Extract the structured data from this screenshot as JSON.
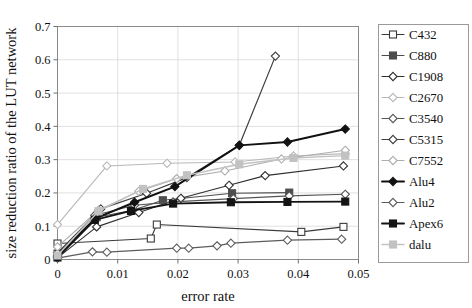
{
  "chart_data": {
    "type": "line",
    "title": "",
    "xlabel": "error rate",
    "ylabel": "size reduction ratio of the LUT network",
    "xlim": [
      0,
      0.05
    ],
    "ylim": [
      0,
      0.7
    ],
    "xticks": [
      0,
      0.01,
      0.02,
      0.03,
      0.04,
      0.05
    ],
    "xtick_labels": [
      "0",
      "0.01",
      "0.02",
      "0.03",
      "0.04",
      "0.05"
    ],
    "yticks": [
      0,
      0.1,
      0.2,
      0.3,
      0.4,
      0.5,
      0.6,
      0.7
    ],
    "ytick_labels": [
      "0",
      "0.1",
      "0.2",
      "0.3",
      "0.4",
      "0.5",
      "0.6",
      "0.7"
    ],
    "grid": true,
    "legend_position": "right",
    "series": [
      {
        "name": "C432",
        "color": "#3a3a3a",
        "marker": "square-open",
        "line_width": 1.1,
        "x": [
          0,
          0.0155,
          0.0165,
          0.0405,
          0.0475
        ],
        "y": [
          0.048,
          0.063,
          0.105,
          0.083,
          0.098
        ]
      },
      {
        "name": "C880",
        "color": "#4d4d4d",
        "marker": "square-filled",
        "line_width": 1.1,
        "x": [
          0,
          0.0065,
          0.0125,
          0.0175,
          0.029,
          0.0385
        ],
        "y": [
          0.018,
          0.127,
          0.148,
          0.178,
          0.199,
          0.201
        ]
      },
      {
        "name": "C1908",
        "color": "#2e2e2e",
        "marker": "diamond-open",
        "line_width": 1.1,
        "x": [
          0,
          0.0065,
          0.0135,
          0.0205,
          0.0285,
          0.0345,
          0.0475
        ],
        "y": [
          0.005,
          0.098,
          0.141,
          0.184,
          0.223,
          0.252,
          0.281
        ]
      },
      {
        "name": "C2670",
        "color": "#b8b8b8",
        "marker": "diamond-open",
        "line_width": 1.1,
        "x": [
          0,
          0.0082,
          0.0182,
          0.0295,
          0.0392,
          0.0478
        ],
        "y": [
          0.105,
          0.281,
          0.289,
          0.293,
          0.311,
          0.318
        ]
      },
      {
        "name": "C3540",
        "color": "#555555",
        "marker": "diamond-open",
        "line_width": 1.1,
        "x": [
          0,
          0.0062,
          0.0128,
          0.0192,
          0.0292,
          0.0385,
          0.0478
        ],
        "y": [
          0.012,
          0.133,
          0.163,
          0.173,
          0.183,
          0.191,
          0.196
        ]
      },
      {
        "name": "C5315",
        "color": "#3d3d3d",
        "marker": "diamond-open",
        "line_width": 1.2,
        "x": [
          0,
          0.0072,
          0.0148,
          0.0215,
          0.0302,
          0.0362
        ],
        "y": [
          0.02,
          0.152,
          0.199,
          0.246,
          0.343,
          0.611
        ]
      },
      {
        "name": "C7552",
        "color": "#adadad",
        "marker": "diamond-open",
        "line_width": 1.1,
        "x": [
          0,
          0.0068,
          0.0135,
          0.0198,
          0.0278,
          0.0372,
          0.0478
        ],
        "y": [
          0.038,
          0.148,
          0.205,
          0.243,
          0.266,
          0.302,
          0.328
        ]
      },
      {
        "name": "Alu4",
        "color": "#111111",
        "marker": "diamond-filled",
        "line_width": 1.9,
        "x": [
          0,
          0.0062,
          0.0128,
          0.0195,
          0.0302,
          0.0382,
          0.0478
        ],
        "y": [
          0.008,
          0.123,
          0.172,
          0.219,
          0.343,
          0.353,
          0.392
        ]
      },
      {
        "name": "Alu2",
        "color": "#5c5c5c",
        "marker": "diamond-open",
        "line_width": 1.2,
        "x": [
          0,
          0.0058,
          0.0082,
          0.0198,
          0.0218,
          0.0265,
          0.0288,
          0.0382,
          0.0472
        ],
        "y": [
          0.004,
          0.023,
          0.022,
          0.034,
          0.034,
          0.041,
          0.049,
          0.058,
          0.061
        ]
      },
      {
        "name": "Apex6",
        "color": "#141414",
        "marker": "square-filled",
        "line_width": 1.9,
        "x": [
          0,
          0.0062,
          0.0122,
          0.0192,
          0.0288,
          0.0382,
          0.0478
        ],
        "y": [
          0.006,
          0.119,
          0.146,
          0.168,
          0.172,
          0.173,
          0.174
        ]
      },
      {
        "name": "dalu",
        "color": "#c2c2c2",
        "marker": "square-filled",
        "line_width": 1.4,
        "x": [
          0,
          0.0068,
          0.0142,
          0.0215,
          0.0302,
          0.0392,
          0.0478
        ],
        "y": [
          0.012,
          0.145,
          0.212,
          0.253,
          0.286,
          0.305,
          0.312
        ]
      }
    ]
  },
  "legend": {
    "entries": [
      {
        "label": "C432"
      },
      {
        "label": "C880"
      },
      {
        "label": "C1908"
      },
      {
        "label": "C2670"
      },
      {
        "label": "C3540"
      },
      {
        "label": "C5315"
      },
      {
        "label": "C7552"
      },
      {
        "label": "Alu4"
      },
      {
        "label": "Alu2"
      },
      {
        "label": "Apex6"
      },
      {
        "label": "dalu"
      }
    ]
  }
}
